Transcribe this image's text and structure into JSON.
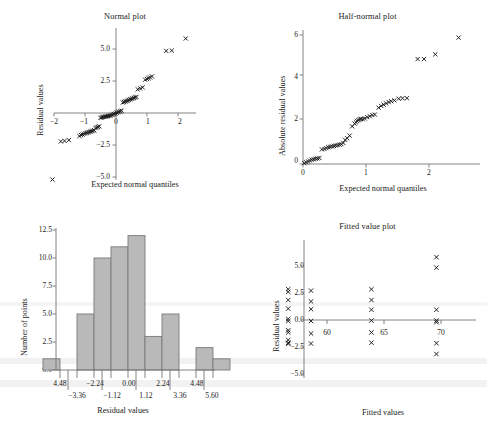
{
  "figure": {
    "background": "#ffffff",
    "marker_color": "#1a1a1a",
    "axis_color": "#6e6e6e",
    "bar_fill": "#b9b9b9",
    "bar_stroke": "#7a7a7a",
    "panels": [
      "normal-plot",
      "half-normal-plot",
      "histogram",
      "fitted-value-plot"
    ]
  },
  "chart_data": [
    {
      "id": "normal-plot",
      "type": "scatter",
      "title": "Normal plot",
      "xlabel": "Expected normal quantiles",
      "ylabel": "Residual values",
      "xlim": [
        -2.5,
        2.5
      ],
      "ylim": [
        -5.8,
        6.2
      ],
      "xticks": [
        -2,
        -1,
        0,
        1,
        2
      ],
      "xticklabels": [
        "−2",
        "−1",
        "0",
        "1",
        "2"
      ],
      "yticks": [
        -5.0,
        -2.5,
        2.5,
        5.0
      ],
      "yticklabels": [
        "−5.0",
        "−2.5",
        "2.5",
        "5.0"
      ],
      "grid": false,
      "axes_style": "crossed-at-origin",
      "x": [
        -2.05,
        -1.78,
        -1.66,
        -1.52,
        -1.18,
        -1.13,
        -1.08,
        -1.03,
        -0.98,
        -0.94,
        -0.9,
        -0.86,
        -0.82,
        -0.78,
        -0.74,
        -0.7,
        -0.66,
        -0.62,
        -0.58,
        -0.54,
        -0.5,
        -0.46,
        -0.42,
        -0.38,
        -0.34,
        -0.3,
        -0.26,
        -0.22,
        -0.18,
        -0.14,
        -0.1,
        -0.06,
        -0.02,
        0.02,
        0.06,
        0.1,
        0.14,
        0.18,
        0.22,
        0.26,
        0.3,
        0.34,
        0.38,
        0.42,
        0.46,
        0.5,
        0.54,
        0.58,
        0.62,
        0.66,
        0.7,
        0.78,
        0.86,
        0.94,
        1.0,
        1.05,
        1.1,
        1.16,
        1.62,
        1.8,
        2.25
      ],
      "y": [
        -5.2,
        -2.22,
        -2.18,
        -2.12,
        -1.8,
        -1.72,
        -1.68,
        -1.62,
        -1.58,
        -1.54,
        -1.52,
        -1.48,
        -1.44,
        -1.42,
        -1.38,
        -1.35,
        -1.18,
        -1.12,
        -1.08,
        -1.04,
        -0.38,
        -0.34,
        -0.32,
        -0.3,
        -0.28,
        -0.26,
        -0.24,
        -0.22,
        -0.2,
        -0.16,
        -0.12,
        -0.08,
        -0.04,
        0.02,
        0.06,
        0.1,
        0.14,
        0.18,
        0.82,
        0.86,
        0.9,
        0.94,
        0.98,
        1.02,
        1.06,
        1.1,
        1.14,
        1.18,
        1.22,
        1.26,
        1.85,
        1.92,
        2.0,
        2.6,
        2.66,
        2.72,
        2.78,
        2.86,
        4.85,
        4.88,
        5.82
      ]
    },
    {
      "id": "half-normal-plot",
      "type": "scatter",
      "title": "Half-normal plot",
      "xlabel": "Expected normal quantiles",
      "ylabel": "Absolute residual values",
      "xlim": [
        -0.08,
        2.62
      ],
      "ylim": [
        -0.25,
        6.4
      ],
      "xticks": [
        0,
        1,
        2
      ],
      "xticklabels": [
        "0",
        "1",
        "2"
      ],
      "yticks": [
        0,
        2,
        4,
        6
      ],
      "yticklabels": [
        "0",
        "2",
        "4",
        "6"
      ],
      "grid": false,
      "axes_style": "L-shaped",
      "x": [
        0.02,
        0.05,
        0.08,
        0.11,
        0.14,
        0.17,
        0.2,
        0.23,
        0.26,
        0.3,
        0.34,
        0.37,
        0.4,
        0.43,
        0.46,
        0.49,
        0.52,
        0.55,
        0.58,
        0.61,
        0.64,
        0.67,
        0.7,
        0.74,
        0.78,
        0.82,
        0.84,
        0.86,
        0.88,
        0.9,
        0.92,
        0.95,
        0.98,
        1.02,
        1.06,
        1.1,
        1.14,
        1.2,
        1.24,
        1.28,
        1.32,
        1.36,
        1.4,
        1.45,
        1.52,
        1.58,
        1.65,
        1.82,
        1.92,
        2.1,
        2.47
      ],
      "y": [
        0.04,
        0.08,
        0.12,
        0.16,
        0.2,
        0.22,
        0.24,
        0.26,
        0.28,
        0.68,
        0.7,
        0.74,
        0.78,
        0.8,
        0.82,
        0.84,
        0.86,
        0.88,
        0.9,
        0.92,
        0.98,
        1.12,
        1.2,
        1.32,
        1.75,
        1.88,
        1.94,
        2.0,
        2.04,
        2.08,
        2.1,
        2.08,
        2.12,
        2.18,
        2.22,
        2.28,
        2.3,
        2.62,
        2.7,
        2.76,
        2.82,
        2.88,
        2.92,
        2.96,
        3.04,
        3.06,
        3.06,
        4.88,
        4.88,
        5.1,
        5.88
      ]
    },
    {
      "id": "histogram",
      "type": "bar",
      "title": "",
      "xlabel": "Residual values",
      "ylabel": "Number of points",
      "yticks": [
        0.0,
        2.5,
        5.0,
        7.5,
        10.0,
        12.5
      ],
      "yticklabels": [
        "0.0",
        "2.5",
        "5.0",
        "7.5",
        "10.0",
        "12.5"
      ],
      "ylim": [
        0,
        13.4
      ],
      "xticklabels_upper": [
        "4.48",
        "−2.24",
        "0.00",
        "2.24",
        "4.48"
      ],
      "xticklabels_lower": [
        "−3.36",
        "−1.12",
        "1.12",
        "3.36",
        "5.60"
      ],
      "grid": false,
      "bins": [
        {
          "value": 1,
          "slot": 0
        },
        {
          "value": 0,
          "slot": 1
        },
        {
          "value": 5,
          "slot": 2
        },
        {
          "value": 10,
          "slot": 3
        },
        {
          "value": 11,
          "slot": 4
        },
        {
          "value": 12,
          "slot": 5
        },
        {
          "value": 3,
          "slot": 6
        },
        {
          "value": 5,
          "slot": 7
        },
        {
          "value": 0,
          "slot": 8
        },
        {
          "value": 2,
          "slot": 9
        },
        {
          "value": 1,
          "slot": 10
        }
      ],
      "values": [
        1,
        0,
        5,
        10,
        11,
        12,
        3,
        5,
        0,
        2,
        1
      ]
    },
    {
      "id": "fitted-value-plot",
      "type": "scatter",
      "title": "Fitted value plot",
      "xlabel": "Fitted values",
      "ylabel": "Residual values",
      "xlim": [
        55.8,
        71.8
      ],
      "ylim": [
        -5.9,
        6.4
      ],
      "xticks": [
        60,
        65,
        70
      ],
      "xticklabels": [
        "60",
        "65",
        "70"
      ],
      "yticks": [
        -5.0,
        -2.5,
        0.0,
        2.5,
        5.0
      ],
      "yticklabels": [
        "−5.0",
        "−2.5",
        "0.0",
        "2.5",
        "5.0"
      ],
      "grid": false,
      "axes_style": "crossed-at-zero",
      "x": [
        56.6,
        56.6,
        56.6,
        56.6,
        56.6,
        56.6,
        56.6,
        56.6,
        56.6,
        56.6,
        56.6,
        58.6,
        58.6,
        58.6,
        58.6,
        58.6,
        58.6,
        63.9,
        63.9,
        63.9,
        63.9,
        63.9,
        63.9,
        69.6,
        69.6,
        69.6,
        69.6,
        69.6,
        69.6,
        69.6
      ],
      "y": [
        2.85,
        2.6,
        1.85,
        1.05,
        0.1,
        -0.1,
        -0.95,
        -1.15,
        -1.85,
        -2.1,
        -2.2,
        2.72,
        1.72,
        1.0,
        -0.1,
        -1.25,
        -2.18,
        2.85,
        1.85,
        0.95,
        -0.05,
        -1.15,
        -2.1,
        5.82,
        4.85,
        0.95,
        -0.05,
        -0.2,
        -2.15,
        -3.15,
        -5.2
      ]
    }
  ]
}
